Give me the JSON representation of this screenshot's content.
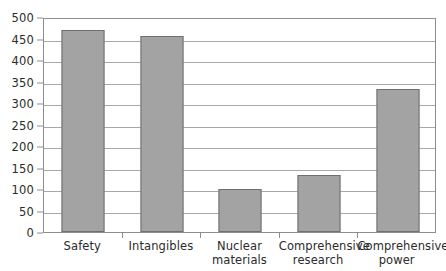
{
  "chart_data": {
    "type": "bar",
    "title": "",
    "subtitle": "",
    "xlabel": "",
    "ylabel": "",
    "categories": [
      "Safety",
      "Intangibles",
      "Nuclear materials",
      "Comprehensive research",
      "Comprehensive power"
    ],
    "category_lines": [
      [
        "Safety"
      ],
      [
        "Intangibles"
      ],
      [
        "Nuclear",
        "materials"
      ],
      [
        "Comprehensive",
        "research"
      ],
      [
        "Comprehensive",
        "power"
      ]
    ],
    "values": [
      470,
      455,
      100,
      133,
      333
    ],
    "ylim": [
      0,
      500
    ],
    "ytick_values": [
      0,
      50,
      100,
      150,
      200,
      250,
      300,
      350,
      400,
      450,
      500
    ],
    "ytick_labels": [
      "0",
      "50",
      "100",
      "150",
      "200",
      "250",
      "300",
      "350",
      "400",
      "450",
      "500"
    ],
    "grid": true,
    "grid_axis": "y",
    "legend": false,
    "legend_position": "none",
    "series": [
      {
        "name": "value",
        "values": [
          470,
          455,
          100,
          133,
          333
        ]
      }
    ],
    "colors": {
      "bar_fill": "#a3a3a3",
      "bar_edge": "#6f6f6f",
      "gridline": "#a8a8a8",
      "axis": "#8d8d8d",
      "text": "#2b2b2b",
      "background": "#ffffff"
    }
  }
}
